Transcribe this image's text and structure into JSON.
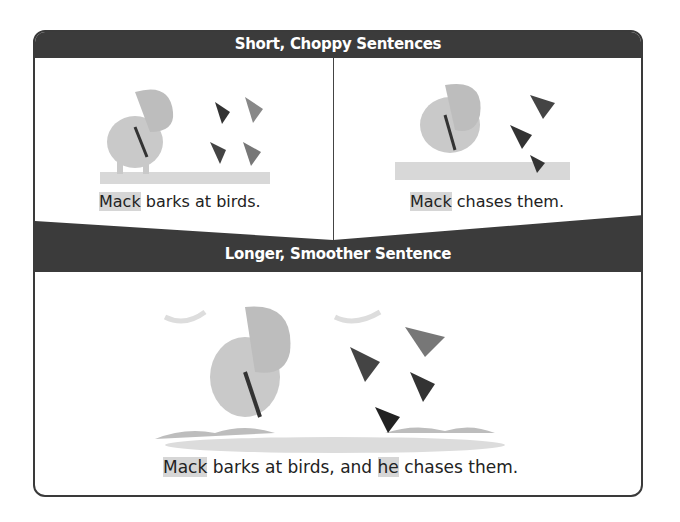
{
  "top_section": {
    "title": "Short, Choppy Sentences",
    "left_panel": {
      "caption_subject": "Mack",
      "caption_rest": " barks at birds.",
      "illustration": "dog-barking-at-birds"
    },
    "right_panel": {
      "caption_subject": "Mack",
      "caption_rest": " chases them.",
      "illustration": "dog-chasing-birds"
    }
  },
  "bottom_section": {
    "title": "Longer, Smoother Sentence",
    "caption_subject": "Mack",
    "caption_mid": " barks at birds, and ",
    "caption_pronoun": "he",
    "caption_rest": " chases them.",
    "illustration": "dog-chasing-flock"
  },
  "colors": {
    "band": "#3b3b3b",
    "highlight": "#d6d6d6",
    "text": "#222222"
  }
}
